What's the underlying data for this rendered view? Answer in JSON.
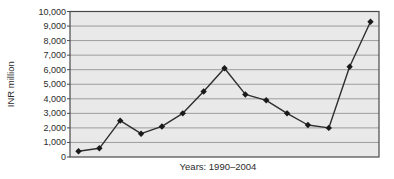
{
  "chart_data": {
    "type": "line",
    "x": [
      1990,
      1991,
      1992,
      1993,
      1994,
      1995,
      1996,
      1997,
      1998,
      1999,
      2000,
      2001,
      2002,
      2003,
      2004
    ],
    "series": [
      {
        "name": "INR million",
        "values": [
          400,
          600,
          2500,
          1600,
          2100,
          3000,
          4500,
          6100,
          4300,
          3900,
          3000,
          2200,
          2000,
          6200,
          9300
        ]
      }
    ],
    "title": "",
    "xlabel": "Years: 1990–2004",
    "ylabel": "INR million",
    "ylim": [
      0,
      10000
    ],
    "ytick_step": 1000,
    "ytick_labels": [
      "0",
      "1,000",
      "2,000",
      "3,000",
      "4,000",
      "5,000",
      "6,000",
      "7,000",
      "8,000",
      "9,000",
      "10,000"
    ],
    "grid": true,
    "legend_position": "none",
    "marker": "diamond"
  },
  "colors": {
    "page_bg": "#ffffff",
    "plot_bg": "#e9e9e9",
    "grid": "#9c9c9c",
    "frame": "#4a4a4a",
    "line": "#2e2e2e",
    "marker": "#1a1a1a",
    "text": "#2b2b2b"
  }
}
